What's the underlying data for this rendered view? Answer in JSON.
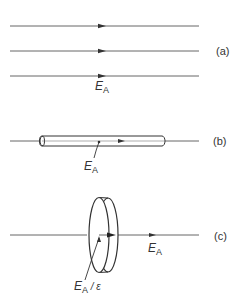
{
  "figure": {
    "colors": {
      "line": "#444444",
      "text": "#333333",
      "background": "#ffffff"
    },
    "panels": [
      {
        "id": "a",
        "label": "(a)",
        "description": "Three parallel uniform field lines",
        "field_label": {
          "symbol": "E",
          "subscript": "A"
        }
      },
      {
        "id": "b",
        "label": "(b)",
        "description": "Thin rod (needle-shaped cavity) aligned with field",
        "field_label": {
          "symbol": "E",
          "subscript": "A"
        }
      },
      {
        "id": "c",
        "label": "(c)",
        "description": "Flat disk perpendicular to field",
        "inside_label": {
          "symbol": "E",
          "subscript": "A",
          "suffix": " / ε"
        },
        "field_label": {
          "symbol": "E",
          "subscript": "A"
        }
      }
    ]
  }
}
